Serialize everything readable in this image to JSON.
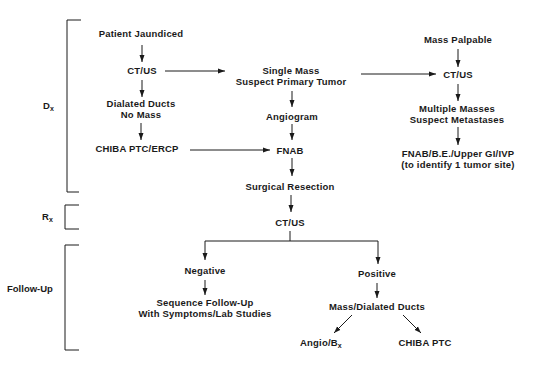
{
  "phases": {
    "dx": {
      "main": "D",
      "sub": "x"
    },
    "rx": {
      "main": "R",
      "sub": "x"
    },
    "follow_up": "Follow-Up"
  },
  "nodes": {
    "patient_jaundiced": "Patient Jaundiced",
    "ct_us_left": "CT/US",
    "dialated_ducts_line1": "Dialated Ducts",
    "dialated_ducts_line2": "No Mass",
    "chiba_ptc_ercp": "CHIBA PTC/ERCP",
    "single_mass_line1": "Single Mass",
    "single_mass_line2": "Suspect Primary Tumor",
    "angiogram": "Angiogram",
    "fnab": "FNAB",
    "mass_palpable": "Mass Palpable",
    "ct_us_right": "CT/US",
    "multiple_masses_line1": "Multiple Masses",
    "multiple_masses_line2": "Suspect Metastases",
    "fnab_be_line1": "FNAB/B.E./Upper GI/IVP",
    "fnab_be_line2": "(to identify 1 tumor site)",
    "surgical_resection": "Surgical Resection",
    "ct_us_followup": "CT/US",
    "negative": "Negative",
    "sequence_line1": "Sequence Follow-Up",
    "sequence_line2": "With Symptoms/Lab Studies",
    "positive": "Positive",
    "mass_dialated_ducts": "Mass/Dialated Ducts",
    "angio_bx": {
      "main": "Angio/B",
      "sub": "x"
    },
    "chiba_ptc": "CHIBA PTC"
  },
  "colors": {
    "ink": "#1a1a1a",
    "background": "#ffffff"
  }
}
